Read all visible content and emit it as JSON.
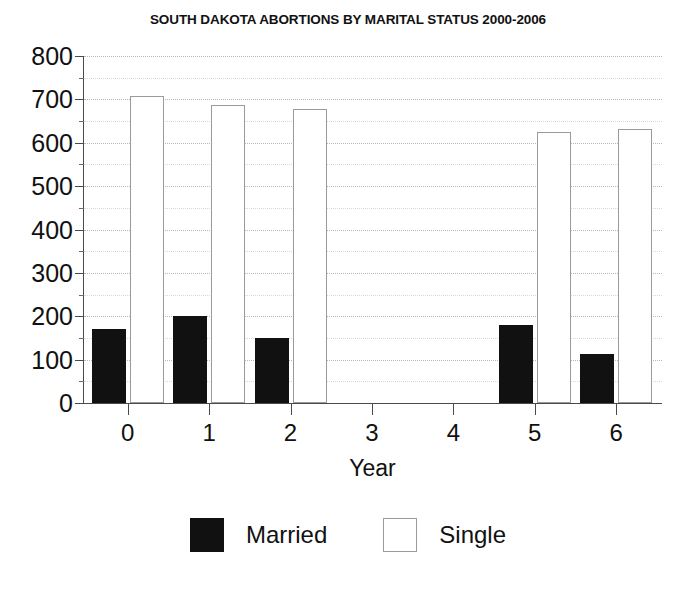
{
  "chart_data": {
    "type": "bar",
    "title": "SOUTH DAKOTA ABORTIONS BY MARITAL STATUS 2000-2006",
    "xlabel": "Year",
    "ylabel": "",
    "categories": [
      "0",
      "1",
      "2",
      "3",
      "4",
      "5",
      "6"
    ],
    "series": [
      {
        "name": "Married",
        "color": "#111111",
        "values": [
          170,
          200,
          150,
          null,
          null,
          180,
          113
        ]
      },
      {
        "name": "Single",
        "color": "#ffffff",
        "values": [
          708,
          688,
          677,
          null,
          null,
          625,
          632
        ]
      }
    ],
    "ylim": [
      0,
      800
    ],
    "ytick_values": [
      0,
      100,
      200,
      300,
      400,
      500,
      600,
      700,
      800
    ],
    "ytick_labels": [
      "0",
      "100",
      "200",
      "300",
      "400",
      "500",
      "600",
      "700",
      "800"
    ],
    "yminor_values": [
      50,
      150,
      250,
      350,
      450,
      550,
      650,
      750
    ],
    "grid": true,
    "grid_style": "dotted",
    "legend_position": "bottom"
  },
  "legend": {
    "entries": [
      {
        "label": "Married",
        "swatch": "filled-black-square"
      },
      {
        "label": "Single",
        "swatch": "outlined-white-square"
      }
    ]
  }
}
